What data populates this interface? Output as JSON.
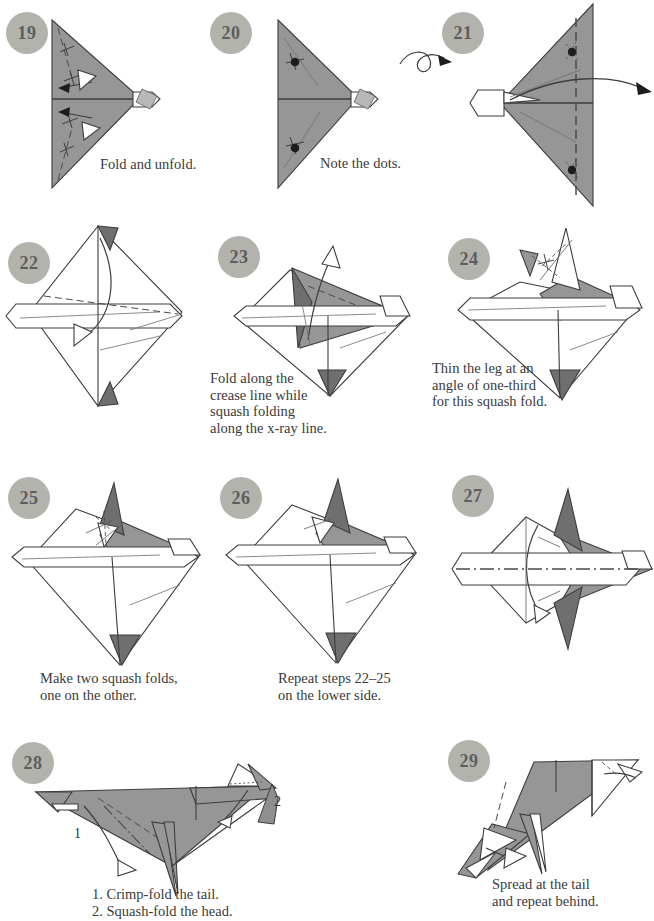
{
  "document": {
    "type": "origami-instruction-diagram",
    "page_background": "#ffffff",
    "ink_color": "#3a3a3a",
    "paper_gray": "#969696",
    "paper_white": "#ffffff",
    "badge_fill": "#b3b3ae",
    "badge_text_color": "#5d5d5d"
  },
  "steps": [
    {
      "number": "19",
      "caption": "Fold and unfold.",
      "symbols": [
        "valley-fold-dashed-lines",
        "fold-and-unfold-arrows",
        "hollow-arrowheads"
      ]
    },
    {
      "number": "20",
      "caption": "Note the dots.",
      "symbols": [
        "reference-dots",
        "crease-lines"
      ]
    },
    {
      "number": "21",
      "caption": "",
      "symbols": [
        "turn-over-arrow",
        "fold-arrow",
        "x-ray-dotted-lines",
        "reference-dots"
      ]
    },
    {
      "number": "22",
      "caption": "",
      "symbols": [
        "valley-fold-dashed-line",
        "fold-arrow-down"
      ]
    },
    {
      "number": "23",
      "caption": "Fold along the\ncrease line while\nsquash folding\nalong the x-ray line.",
      "symbols": [
        "squash-fold-arrow-up",
        "dashed-crease"
      ]
    },
    {
      "number": "24",
      "caption": "Thin the leg at an\nangle of one-third\nfor this squash fold.",
      "symbols": [
        "squash-fold-marks",
        "dashed-crease"
      ]
    },
    {
      "number": "25",
      "caption": "Make two squash folds,\none on the other.",
      "symbols": [
        "squash-fold-marks"
      ]
    },
    {
      "number": "26",
      "caption": "Repeat steps 22–25\non the lower side.",
      "symbols": []
    },
    {
      "number": "27",
      "caption": "",
      "symbols": [
        "mountain-fold-dash-dot-line",
        "close-fold-arrow"
      ]
    },
    {
      "number": "28",
      "caption": "1. Crimp-fold the tail.\n2. Squash-fold the head.",
      "labels": [
        "1",
        "2"
      ],
      "symbols": [
        "crimp-fold-dashed-lines",
        "hollow-arrow",
        "filled-push-arrow"
      ]
    },
    {
      "number": "29",
      "caption": "Spread at the tail\nand repeat behind.",
      "symbols": [
        "spread-arrows",
        "hollow-arrowheads"
      ]
    }
  ]
}
